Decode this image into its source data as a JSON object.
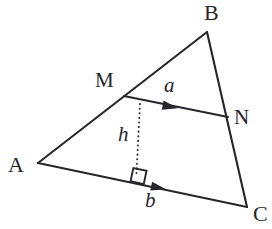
{
  "figure": {
    "background_color": "#ffffff",
    "stroke_color": "#26262b",
    "label_color": "#26262b",
    "vertices": {
      "A": {
        "label": "A",
        "x": 38,
        "y": 163,
        "label_x": 8,
        "label_y": 154
      },
      "B": {
        "label": "B",
        "x": 207,
        "y": 32,
        "label_x": 204,
        "label_y": 2
      },
      "C": {
        "label": "C",
        "x": 247,
        "y": 207,
        "label_x": 253,
        "label_y": 203
      },
      "M": {
        "label": "M",
        "x": 124,
        "y": 96,
        "label_x": 95,
        "label_y": 70
      },
      "N": {
        "label": "N",
        "x": 228,
        "y": 117,
        "label_x": 234,
        "label_y": 107
      }
    },
    "measures": {
      "a": {
        "label": "a",
        "label_x": 164,
        "label_y": 75,
        "description": "vector along midsegment MN"
      },
      "b": {
        "label": "b",
        "label_x": 145,
        "label_y": 190,
        "description": "vector along base AC"
      },
      "h": {
        "label": "h",
        "label_x": 118,
        "label_y": 124,
        "description": "perpendicular height from MN to AC"
      }
    },
    "segments": [
      {
        "name": "side-AB",
        "from": "A",
        "to": "B",
        "style": "solid"
      },
      {
        "name": "side-BC",
        "from": "B",
        "to": "C",
        "style": "solid"
      },
      {
        "name": "side-AC",
        "from": "A",
        "to": "C",
        "style": "solid"
      },
      {
        "name": "midsegment-MN",
        "from": "M",
        "to": "N",
        "style": "solid"
      },
      {
        "name": "height-h",
        "from": "MN",
        "to": "AC",
        "style": "dotted"
      }
    ],
    "markers": {
      "right_angle": {
        "name": "right-angle-marker",
        "x": 133,
        "y": 172
      },
      "arrow_a": {
        "name": "arrowhead-a",
        "x": 172,
        "y": 107
      },
      "arrow_b": {
        "name": "arrowhead-b",
        "x": 160,
        "y": 188
      }
    }
  }
}
